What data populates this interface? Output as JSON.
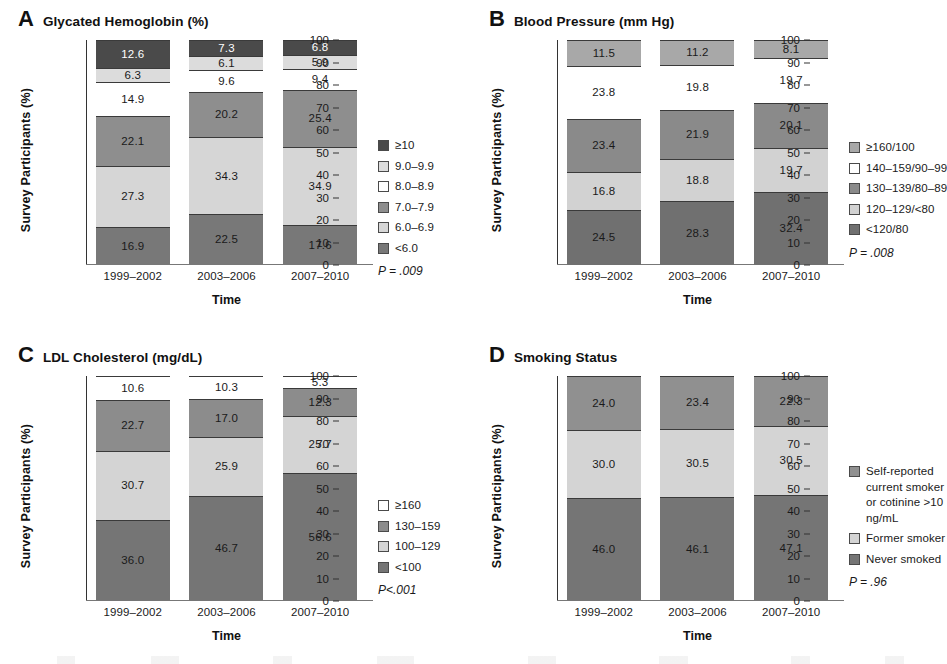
{
  "figure": {
    "axis": {
      "ylabel": "Survey Participants (%)",
      "xlabel": "Time",
      "yticks": [
        "100",
        "90",
        "80",
        "70",
        "60",
        "50",
        "40",
        "30",
        "20",
        "10",
        "0"
      ],
      "categories": [
        "1999–2002",
        "2003–2006",
        "2007–2010"
      ]
    },
    "panels": [
      {
        "letter": "A",
        "title": "Glycated Hemoglobin (%)",
        "pvalue": "P = .009"
      },
      {
        "letter": "B",
        "title": "Blood Pressure (mm Hg)",
        "pvalue": "P = .008"
      },
      {
        "letter": "C",
        "title": "LDL Cholesterol (mg/dL)",
        "pvalue": "P<.001"
      },
      {
        "letter": "D",
        "title": "Smoking Status",
        "pvalue": "P = .96"
      }
    ]
  },
  "chart_data": [
    {
      "type": "bar",
      "id": "panel-a",
      "panel": "A",
      "title": "Glycated Hemoglobin (%)",
      "xlabel": "Time",
      "ylabel": "Survey Participants (%)",
      "ylim": [
        0,
        100
      ],
      "stacked": true,
      "grid": false,
      "legend_position": "right",
      "annotations": [
        "P = .009"
      ],
      "categories": [
        "1999–2002",
        "2003–2006",
        "2007–2010"
      ],
      "series": [
        {
          "name": "<6.0",
          "color": "#787878",
          "values": [
            16.9,
            22.5,
            17.6
          ]
        },
        {
          "name": "6.0–6.9",
          "color": "#d6d6d6",
          "values": [
            27.3,
            34.3,
            34.9
          ]
        },
        {
          "name": "7.0–7.9",
          "color": "#8e8e8e",
          "values": [
            22.1,
            20.2,
            25.4
          ]
        },
        {
          "name": "8.0–8.9",
          "color": "#ffffff",
          "values": [
            14.9,
            9.6,
            9.4
          ]
        },
        {
          "name": "9.0–9.9",
          "color": "#dcdcdc",
          "values": [
            6.3,
            6.1,
            5.9
          ]
        },
        {
          "name": "≥10",
          "color": "#4a4a4a",
          "values": [
            12.6,
            7.3,
            6.8
          ]
        }
      ],
      "legend_order_top_down": [
        "≥10",
        "9.0–9.9",
        "8.0–8.9",
        "7.0–7.9",
        "6.0–6.9",
        "<6.0"
      ]
    },
    {
      "type": "bar",
      "id": "panel-b",
      "panel": "B",
      "title": "Blood Pressure (mm Hg)",
      "xlabel": "Time",
      "ylabel": "Survey Participants (%)",
      "ylim": [
        0,
        100
      ],
      "stacked": true,
      "grid": false,
      "legend_position": "right",
      "annotations": [
        "P = .008"
      ],
      "categories": [
        "1999–2002",
        "2003–2006",
        "2007–2010"
      ],
      "series": [
        {
          "name": "<120/80",
          "color": "#707070",
          "values": [
            24.5,
            28.3,
            32.4
          ]
        },
        {
          "name": "120–129/<80",
          "color": "#d2d2d2",
          "values": [
            16.8,
            18.8,
            19.7
          ]
        },
        {
          "name": "130–139/80–89",
          "color": "#8a8a8a",
          "values": [
            23.4,
            21.9,
            20.1
          ]
        },
        {
          "name": "140–159/90–99",
          "color": "#ffffff",
          "values": [
            23.8,
            19.8,
            19.7
          ]
        },
        {
          "name": "≥160/100",
          "color": "#a8a8a8",
          "values": [
            11.5,
            11.2,
            8.1
          ]
        }
      ],
      "legend_order_top_down": [
        "≥160/100",
        "140–159/90–99",
        "130–139/80–89",
        "120–129/<80",
        "<120/80"
      ]
    },
    {
      "type": "bar",
      "id": "panel-c",
      "panel": "C",
      "title": "LDL Cholesterol (mg/dL)",
      "xlabel": "Time",
      "ylabel": "Survey Participants (%)",
      "ylim": [
        0,
        100
      ],
      "stacked": true,
      "grid": false,
      "legend_position": "right",
      "annotations": [
        "P<.001"
      ],
      "categories": [
        "1999–2002",
        "2003–2006",
        "2007–2010"
      ],
      "series": [
        {
          "name": "<100",
          "color": "#757575",
          "values": [
            36.0,
            46.7,
            56.6
          ]
        },
        {
          "name": "100–129",
          "color": "#d4d4d4",
          "values": [
            30.7,
            25.9,
            25.7
          ]
        },
        {
          "name": "130–159",
          "color": "#8c8c8c",
          "values": [
            22.7,
            17.0,
            12.3
          ]
        },
        {
          "name": "≥160",
          "color": "#ffffff",
          "values": [
            10.6,
            10.3,
            5.3
          ]
        }
      ],
      "legend_order_top_down": [
        "≥160",
        "130–159",
        "100–129",
        "<100"
      ]
    },
    {
      "type": "bar",
      "id": "panel-d",
      "panel": "D",
      "title": "Smoking Status",
      "xlabel": "Time",
      "ylabel": "Survey Participants (%)",
      "ylim": [
        0,
        100
      ],
      "stacked": true,
      "grid": false,
      "legend_position": "right",
      "annotations": [
        "P = .96"
      ],
      "categories": [
        "1999–2002",
        "2003–2006",
        "2007–2010"
      ],
      "series": [
        {
          "name": "Never smoked",
          "color": "#757575",
          "values": [
            46.0,
            46.1,
            47.1
          ]
        },
        {
          "name": "Former smoker",
          "color": "#d4d4d4",
          "values": [
            30.0,
            30.5,
            30.5
          ]
        },
        {
          "name": "Self-reported current smoker or cotinine >10 ng/mL",
          "color": "#909090",
          "values": [
            24.0,
            23.4,
            22.3
          ]
        }
      ],
      "legend_order_top_down": [
        "Self-reported current smoker or cotinine >10 ng/mL",
        "Former smoker",
        "Never smoked"
      ]
    }
  ]
}
